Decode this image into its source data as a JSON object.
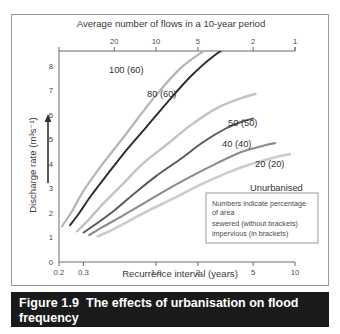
{
  "figure": {
    "caption_label": "Figure 1.9",
    "caption_text": "The effects of urbanisation on flood frequency"
  },
  "chart_data": {
    "type": "line",
    "title": "",
    "xlabel": "Recurrence interval (years)",
    "ylabel": "Discharge rate (m³s⁻¹)",
    "top_axis_label": "Average number of flows in a 10-year period",
    "x_scale": "log",
    "xlim": [
      0.2,
      10
    ],
    "ylim": [
      0,
      8.6
    ],
    "grid": false,
    "legend_position": "inline-labels",
    "x_ticks": [
      "0.2",
      "0.3",
      "1.0",
      "2",
      "5",
      "10"
    ],
    "x_tick_values": [
      0.2,
      0.3,
      1.0,
      2,
      5,
      10
    ],
    "y_ticks": [
      "0",
      "1",
      "2",
      "3",
      "4",
      "5",
      "6",
      "7",
      "8"
    ],
    "y_tick_values": [
      0,
      1,
      2,
      3,
      4,
      5,
      6,
      7,
      8
    ],
    "top_ticks": [
      "20",
      "10",
      "5",
      "2",
      "1"
    ],
    "top_tick_values": [
      20,
      10,
      5,
      2,
      1
    ],
    "annotation": {
      "line1": "Numbers indicate percentage",
      "line2": "of area",
      "line3": "sewered (without brackets)",
      "line4": "impervious (in brackets)"
    },
    "series": [
      {
        "name": "100 (60)",
        "label": "100 (60)",
        "color": "#b4b4b4",
        "sewered_percent": 100,
        "impervious_percent": 60,
        "x": [
          0.21,
          0.25,
          0.3,
          0.4,
          0.55,
          0.75,
          1.0,
          1.5,
          2.2,
          3.2
        ],
        "y": [
          1.45,
          2.1,
          2.9,
          3.9,
          4.9,
          5.9,
          6.8,
          7.9,
          8.6,
          9.2
        ]
      },
      {
        "name": "80 (60)",
        "label": "80 (60)",
        "color": "#2b2b2b",
        "sewered_percent": 80,
        "impervious_percent": 60,
        "x": [
          0.24,
          0.28,
          0.34,
          0.45,
          0.62,
          0.85,
          1.2,
          1.8,
          2.6,
          3.8
        ],
        "y": [
          1.5,
          2.0,
          2.7,
          3.6,
          4.6,
          5.5,
          6.5,
          7.6,
          8.4,
          9.0
        ]
      },
      {
        "name": "50 (50)",
        "label": "50 (50)",
        "color": "#c2c2c2",
        "sewered_percent": 50,
        "impervious_percent": 50,
        "x": [
          0.27,
          0.33,
          0.42,
          0.58,
          0.8,
          1.2,
          1.8,
          2.8,
          4.2,
          5.2
        ],
        "y": [
          1.25,
          1.75,
          2.4,
          3.2,
          4.0,
          4.8,
          5.6,
          6.3,
          6.7,
          6.85
        ]
      },
      {
        "name": "40 (40)",
        "label": "40 (40)",
        "color": "#585858",
        "sewered_percent": 40,
        "impervious_percent": 40,
        "x": [
          0.3,
          0.38,
          0.5,
          0.7,
          1.0,
          1.5,
          2.2,
          3.2,
          4.3,
          5.0
        ],
        "y": [
          1.2,
          1.6,
          2.1,
          2.8,
          3.5,
          4.2,
          4.9,
          5.45,
          5.75,
          5.85
        ]
      },
      {
        "name": "20 (20)",
        "label": "20 (20)",
        "color": "#8c8c8c",
        "sewered_percent": 20,
        "impervious_percent": 20,
        "x": [
          0.33,
          0.42,
          0.58,
          0.82,
          1.2,
          1.8,
          2.8,
          4.2,
          6.0,
          7.2
        ],
        "y": [
          1.1,
          1.45,
          1.9,
          2.4,
          2.95,
          3.5,
          4.05,
          4.5,
          4.75,
          4.85
        ]
      },
      {
        "name": "Unurbanised",
        "label": "Unurbanised",
        "color": "#cccccc",
        "sewered_percent": 0,
        "impervious_percent": 0,
        "x": [
          0.38,
          0.48,
          0.65,
          0.92,
          1.35,
          2.0,
          3.0,
          4.6,
          7.0,
          9.2
        ],
        "y": [
          1.05,
          1.3,
          1.7,
          2.15,
          2.6,
          3.1,
          3.55,
          3.95,
          4.25,
          4.4
        ]
      }
    ]
  }
}
